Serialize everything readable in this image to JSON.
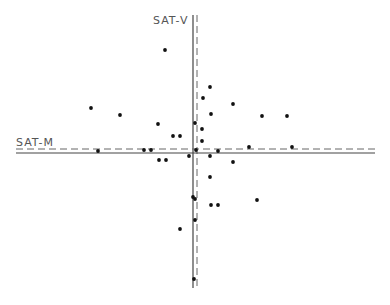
{
  "chart_data": {
    "type": "scatter",
    "title": "",
    "xlabel": "SAT-M",
    "ylabel": "SAT-V",
    "grid": false,
    "legend": null,
    "axes_style": "centered crosshair axes (solid regression line + dashed mean line for each axis), no ticks or tick labels",
    "colors": {
      "points": "#111111",
      "axis_solid": "#444444",
      "axis_dashed": "#666666",
      "label": "#555555"
    },
    "axis_lines": {
      "vertical": {
        "label": "SAT-V",
        "solid_x": 193,
        "dashed_x": 197,
        "y_start": 15,
        "y_end": 288
      },
      "horizontal": {
        "label": "SAT-M",
        "solid_y": 153,
        "dashed_y": 149,
        "x_start": 16,
        "x_end": 375
      }
    },
    "pixel_points": [
      [
        165,
        50
      ],
      [
        91,
        108
      ],
      [
        120,
        115
      ],
      [
        158,
        124
      ],
      [
        195,
        123
      ],
      [
        210,
        87
      ],
      [
        203,
        98
      ],
      [
        233,
        104
      ],
      [
        211,
        114
      ],
      [
        262,
        116
      ],
      [
        287,
        116
      ],
      [
        173,
        136
      ],
      [
        180,
        136
      ],
      [
        202,
        129
      ],
      [
        202,
        141
      ],
      [
        196,
        150
      ],
      [
        98,
        151
      ],
      [
        144,
        150
      ],
      [
        151,
        150
      ],
      [
        218,
        151
      ],
      [
        249,
        147
      ],
      [
        292,
        147
      ],
      [
        210,
        156
      ],
      [
        233,
        162
      ],
      [
        159,
        160
      ],
      [
        166,
        160
      ],
      [
        189,
        156
      ],
      [
        210,
        177
      ],
      [
        257,
        200
      ],
      [
        193,
        197
      ],
      [
        195,
        199
      ],
      [
        211,
        205
      ],
      [
        218,
        205
      ],
      [
        195,
        220
      ],
      [
        180,
        229
      ],
      [
        194,
        279
      ]
    ],
    "points_relative_to_axes": {
      "description": "x = pixel_x - 195, y = 151 - pixel_y (origin at axes crossing, positive y upward)",
      "x": [
        -30,
        -104,
        -75,
        -37,
        0,
        15,
        8,
        38,
        16,
        67,
        92,
        -22,
        -15,
        7,
        7,
        1,
        -97,
        -51,
        -44,
        23,
        54,
        97,
        15,
        38,
        -36,
        -29,
        -6,
        15,
        62,
        -2,
        0,
        16,
        23,
        0,
        -15,
        -1
      ],
      "y": [
        101,
        43,
        36,
        27,
        28,
        64,
        53,
        47,
        37,
        35,
        35,
        15,
        15,
        22,
        10,
        1,
        0,
        1,
        1,
        0,
        4,
        4,
        -5,
        -11,
        -9,
        -9,
        -5,
        -26,
        -49,
        -46,
        -48,
        -54,
        -54,
        -69,
        -78,
        -128
      ]
    }
  }
}
